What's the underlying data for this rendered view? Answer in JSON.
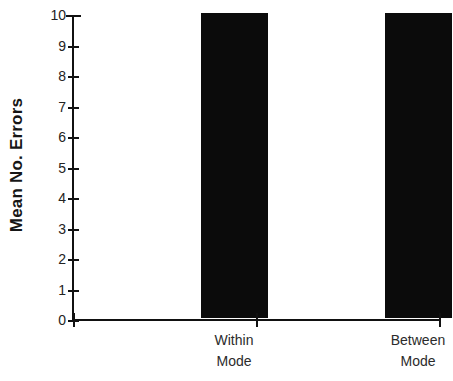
{
  "chart_data": {
    "type": "bar",
    "title": "",
    "subtitle": "",
    "xlabel": "",
    "ylabel": "Mean No. Errors",
    "categories": [
      "Within Mode",
      "Between Mode"
    ],
    "category_lines": [
      [
        "Within",
        "Mode"
      ],
      [
        "Between",
        "Mode"
      ]
    ],
    "values": [
      10,
      10
    ],
    "ylim": [
      0,
      10
    ],
    "ytick_labels": [
      "10",
      "9",
      "8",
      "7",
      "6",
      "5",
      "4",
      "3",
      "2",
      "1",
      "0"
    ],
    "ytick_values": [
      10,
      9,
      8,
      7,
      6,
      5,
      4,
      3,
      2,
      1,
      0
    ],
    "grid": false,
    "legend": false,
    "legend_position": "none",
    "bar_color": "#0b0b0b",
    "axis_color": "#111111",
    "background_color": "#ffffff",
    "annotations": []
  }
}
